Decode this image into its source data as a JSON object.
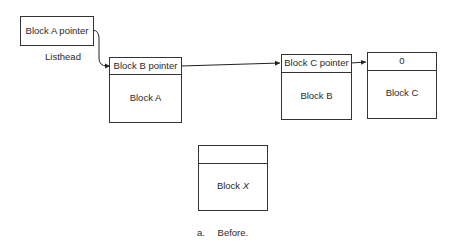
{
  "listhead": {
    "field": "Block A pointer",
    "label": "Listhead"
  },
  "blocks": [
    {
      "id": "A",
      "header": "Block B pointer",
      "name": "Block A"
    },
    {
      "id": "B",
      "header": "Block C pointer",
      "name": "Block B"
    },
    {
      "id": "C",
      "header": "0",
      "name": "Block C"
    }
  ],
  "block_x": {
    "header": "",
    "name_prefix": "Block ",
    "name_var": "X"
  },
  "caption": {
    "letter": "a.",
    "text": "Before."
  }
}
